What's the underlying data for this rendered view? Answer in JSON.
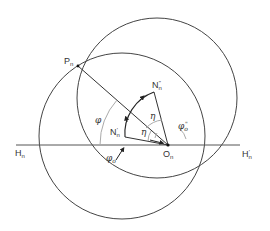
{
  "figure": {
    "type": "geometric-construction",
    "points": {
      "P": {
        "label": "P",
        "sub": "n"
      },
      "O": {
        "label": "O",
        "sub": "n"
      },
      "H_left": {
        "label": "H",
        "sub": "n"
      },
      "H_right": {
        "label": "H",
        "sub": "n",
        "sup": "'"
      },
      "N_prime": {
        "label": "N",
        "sub": "n",
        "sup": "'"
      },
      "N_double_prime": {
        "label": "N",
        "sub": "n",
        "sup": "\""
      }
    },
    "angles": {
      "phi": {
        "label": "φ"
      },
      "phi_o": {
        "label": "φ",
        "sub": "o"
      },
      "phi_o_double": {
        "label": "φ",
        "sub": "o",
        "sup": "\""
      },
      "eta_upper": {
        "label": "η"
      },
      "eta_lower": {
        "label": "η"
      }
    },
    "elements": [
      "circle-upper",
      "circle-lower",
      "horizontal-line-H-H'",
      "line-P-O",
      "line-O-N'",
      "line-O-N''",
      "arc-N'-N''"
    ],
    "colors": {
      "line": "#444444",
      "arc": "#999999"
    }
  }
}
